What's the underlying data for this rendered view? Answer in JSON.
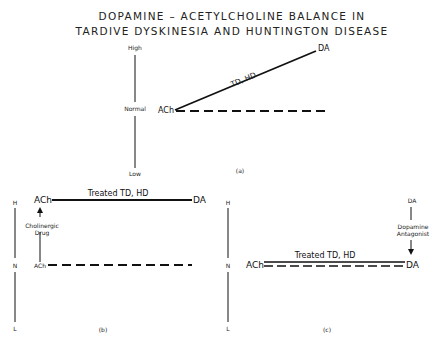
{
  "title": {
    "line1": "DOPAMINE – ACETYLCHOLINE  BALANCE  IN",
    "line2": "TARDIVE  DYSKINESIA  AND  HUNTINGTON  DISEASE"
  },
  "panel_a": {
    "caption": "(a)",
    "axis": {
      "high": "High",
      "normal": "Normal",
      "low": "Low"
    },
    "ach_label": "ACh",
    "da_label": "DA",
    "line_label": "TD, HD"
  },
  "panel_b": {
    "caption": "(b)",
    "axis": {
      "high": "H",
      "normal": "N",
      "low": "L"
    },
    "ach_top_label": "ACh",
    "ach_bottom_label": "ACh",
    "da_label": "DA",
    "line_label": "Treated  TD, HD",
    "arrow_label_1": "Cholinergic",
    "arrow_label_2": "Drug"
  },
  "panel_c": {
    "caption": "(c)",
    "axis": {
      "high": "H",
      "normal": "N",
      "low": "L"
    },
    "ach_label": "ACh",
    "da_top_label": "DA",
    "da_bottom_label": "DA",
    "line_label": "Treated  TD, HD",
    "arrow_label_1": "Dopamine",
    "arrow_label_2": "Antagonist"
  }
}
